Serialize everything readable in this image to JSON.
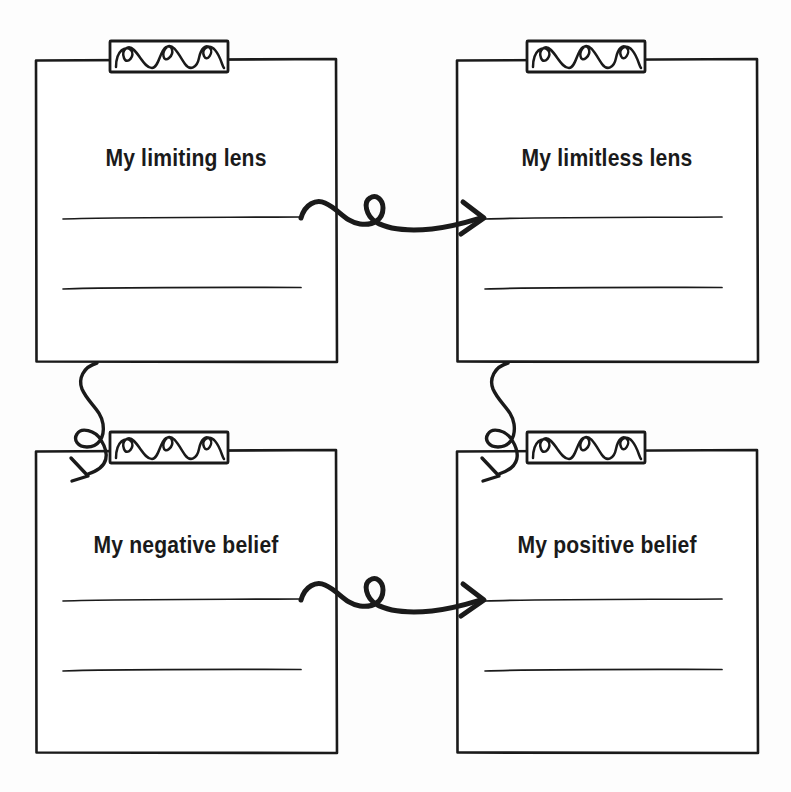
{
  "page": {
    "background_color": "#fdfdfd",
    "ink_color": "#1a1a1a",
    "width": 791,
    "height": 792,
    "style": "hand-drawn worksheet"
  },
  "worksheet": {
    "cards": [
      {
        "id": "limiting-lens",
        "title": "My limiting lens",
        "clip": "spiral-clip",
        "write_lines": 2,
        "position": "top-left"
      },
      {
        "id": "limitless-lens",
        "title": "My limitless lens",
        "clip": "spiral-clip",
        "write_lines": 2,
        "position": "top-right"
      },
      {
        "id": "negative-belief",
        "title": "My negative belief",
        "clip": "spiral-clip",
        "write_lines": 2,
        "position": "bottom-left"
      },
      {
        "id": "positive-belief",
        "title": "My positive belief",
        "clip": "spiral-clip",
        "write_lines": 2,
        "position": "bottom-right"
      }
    ],
    "arrows": [
      {
        "id": "arrow-top-horizontal",
        "icon": "curly-arrow-right-icon",
        "from": "limiting-lens",
        "to": "limitless-lens",
        "direction": "right"
      },
      {
        "id": "arrow-bottom-horizontal",
        "icon": "curly-arrow-right-icon",
        "from": "negative-belief",
        "to": "positive-belief",
        "direction": "right"
      },
      {
        "id": "arrow-left-vertical",
        "icon": "curly-arrow-down-icon",
        "from": "limiting-lens",
        "to": "negative-belief",
        "direction": "down"
      },
      {
        "id": "arrow-right-vertical",
        "icon": "curly-arrow-down-icon",
        "from": "limitless-lens",
        "to": "positive-belief",
        "direction": "down"
      }
    ]
  }
}
